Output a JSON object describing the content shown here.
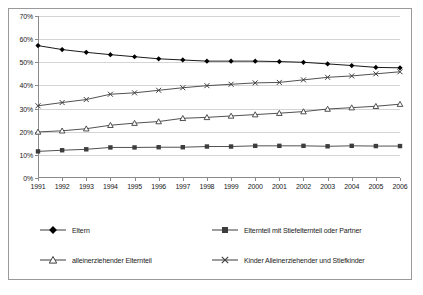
{
  "chart_data": {
    "type": "line",
    "title": "",
    "subtitle": "",
    "xlabel": "",
    "ylabel": "",
    "grid": true,
    "legend_position": "bottom",
    "categories": [
      "1991",
      "1992",
      "1993",
      "1994",
      "1995",
      "1996",
      "1997",
      "1998",
      "1999",
      "2000",
      "2001",
      "2002",
      "2003",
      "2004",
      "2005",
      "2006"
    ],
    "x": [
      1991,
      1992,
      1993,
      1994,
      1995,
      1996,
      1997,
      1998,
      1999,
      2000,
      2001,
      2002,
      2003,
      2004,
      2005,
      2006
    ],
    "ylim": [
      0,
      70
    ],
    "ytick_labels": [
      "0%",
      "10%",
      "20%",
      "30%",
      "40%",
      "50%",
      "60%",
      "70%"
    ],
    "ytick_values": [
      0,
      10,
      20,
      30,
      40,
      50,
      60,
      70
    ],
    "series": [
      {
        "name": "Eltern",
        "marker": "filled-diamond",
        "color": "#000000",
        "values": [
          57.2,
          55.5,
          54.3,
          53.3,
          52.4,
          51.5,
          51.0,
          50.5,
          50.5,
          50.5,
          50.3,
          50.0,
          49.3,
          48.6,
          47.8,
          47.6
        ]
      },
      {
        "name": "Elternteil mit Stiefelternteil oder Partner",
        "marker": "filled-square",
        "color": "#3d3d3d",
        "values": [
          11.5,
          12.0,
          12.4,
          13.2,
          13.2,
          13.3,
          13.3,
          13.6,
          13.6,
          13.9,
          13.9,
          13.9,
          13.7,
          13.9,
          13.8,
          13.8
        ]
      },
      {
        "name": "alleinerziehender Elternteil",
        "marker": "open-triangle",
        "color": "#3d3d3d",
        "values": [
          19.9,
          20.4,
          21.3,
          22.8,
          23.7,
          24.4,
          25.8,
          26.2,
          26.8,
          27.4,
          28.0,
          28.7,
          29.8,
          30.4,
          31.0,
          31.9
        ]
      },
      {
        "name": "Kinder Alleinerziehender und Stiefkinder",
        "marker": "cross",
        "color": "#3d3d3d",
        "values": [
          31.2,
          32.6,
          33.9,
          36.2,
          36.8,
          37.9,
          39.0,
          39.9,
          40.5,
          41.1,
          41.3,
          42.4,
          43.5,
          44.1,
          45.0,
          45.9
        ]
      }
    ]
  },
  "legend": {
    "items": [
      {
        "label": "Eltern",
        "marker": "filled-diamond"
      },
      {
        "label": "Elternteil mit Stiefelternteil oder Partner",
        "marker": "filled-square"
      },
      {
        "label": "alleinerziehender Elternteil",
        "marker": "open-triangle"
      },
      {
        "label": "Kinder Alleinerziehender und Stiefkinder",
        "marker": "cross"
      }
    ]
  }
}
